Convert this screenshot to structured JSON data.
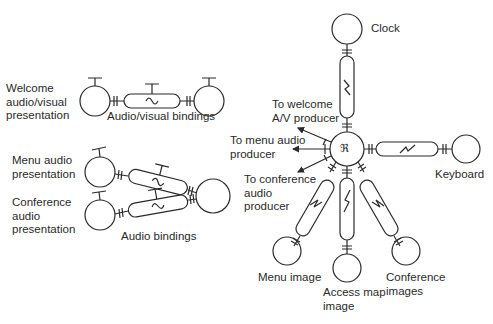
{
  "left_groups": {
    "welcome": {
      "label": "Welcome\naudio/visual\npresentation",
      "binding_label": "Audio/visual bindings"
    },
    "menu": {
      "label": "Menu audio\npresentation"
    },
    "conference": {
      "label": "Conference\naudio\npresentation",
      "binding_label": "Audio bindings"
    }
  },
  "hub": {
    "symbol": "ℜ",
    "arrows": {
      "welcome": "To welcome\nA/V producer",
      "menu": "To menu audio\nproducer",
      "conference": "To conference\naudio\nproducer"
    },
    "nodes": {
      "clock": "Clock",
      "keyboard": "Keyboard",
      "menu_image": "Menu image",
      "access_map_image": "Access map\nimage",
      "conference_images": "Conference\nimages"
    }
  },
  "colors": {
    "stroke": "#2a2a2a",
    "background": "#ffffff"
  }
}
